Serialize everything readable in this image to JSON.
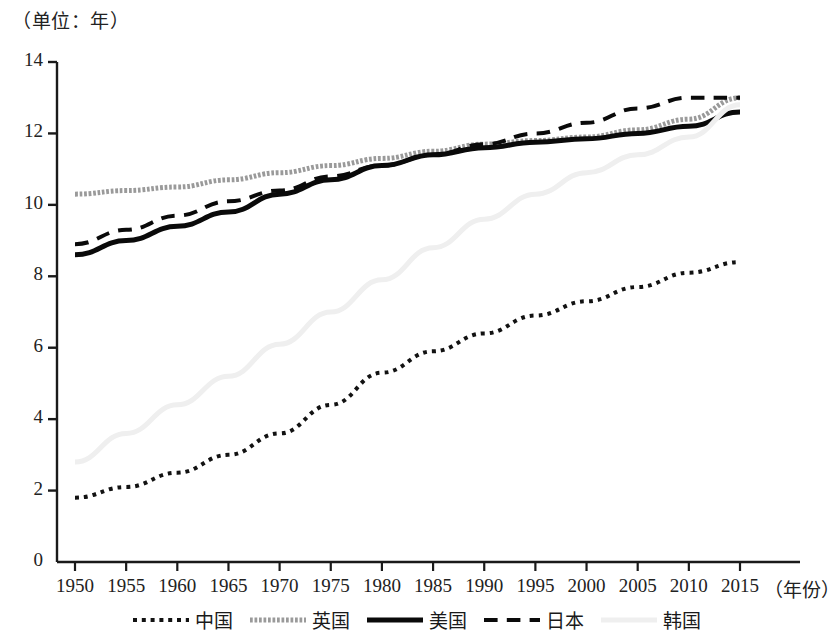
{
  "figure": {
    "unit_label": "（单位：年）",
    "xaxis_title": "（年份）"
  },
  "chart_data": {
    "type": "line",
    "title": "",
    "subtitle": "",
    "unit_note": "（单位：年）",
    "xlabel": "（年份）",
    "ylabel": "",
    "xlim": [
      1950,
      2016
    ],
    "ylim": [
      0,
      14
    ],
    "grid": false,
    "legend_position": "bottom",
    "x_ticks": [
      "1950",
      "1955",
      "1960",
      "1965",
      "1970",
      "1975",
      "1980",
      "1985",
      "1990",
      "1995",
      "2000",
      "2005",
      "2010",
      "2015"
    ],
    "y_ticks": [
      "0",
      "2",
      "4",
      "6",
      "8",
      "10",
      "12",
      "14"
    ],
    "x": [
      1950,
      1955,
      1960,
      1965,
      1970,
      1975,
      1980,
      1985,
      1990,
      1995,
      2000,
      2005,
      2010,
      2015
    ],
    "series": [
      {
        "name": "中国",
        "style": "dotted",
        "color": "#121212",
        "width": 4,
        "values": [
          1.8,
          2.1,
          2.5,
          3.0,
          3.6,
          4.4,
          5.3,
          5.9,
          6.4,
          6.9,
          7.3,
          7.7,
          8.1,
          8.4
        ]
      },
      {
        "name": "英国",
        "style": "textured",
        "color": "#9a9a9a",
        "width": 5,
        "values": [
          10.3,
          10.4,
          10.5,
          10.7,
          10.9,
          11.1,
          11.3,
          11.5,
          11.7,
          11.8,
          11.9,
          12.1,
          12.4,
          13.0
        ]
      },
      {
        "name": "美国",
        "style": "solid",
        "color": "#0a0a0a",
        "width": 5,
        "values": [
          8.6,
          9.0,
          9.4,
          9.8,
          10.3,
          10.7,
          11.1,
          11.4,
          11.6,
          11.75,
          11.85,
          12.0,
          12.2,
          12.6
        ]
      },
      {
        "name": "日本",
        "style": "dashed",
        "color": "#0a0a0a",
        "width": 4,
        "values": [
          8.9,
          9.3,
          9.7,
          10.1,
          10.4,
          10.8,
          11.1,
          11.4,
          11.7,
          12.0,
          12.3,
          12.7,
          13.0,
          13.0
        ]
      },
      {
        "name": "韩国",
        "style": "solid-light",
        "color": "#efefef",
        "width": 5,
        "values": [
          2.8,
          3.6,
          4.4,
          5.2,
          6.1,
          7.0,
          7.9,
          8.8,
          9.6,
          10.3,
          10.9,
          11.4,
          11.9,
          12.8
        ]
      }
    ]
  },
  "legend": {
    "items": [
      {
        "label": "中国",
        "swatch": "dotted-swatch"
      },
      {
        "label": "英国",
        "swatch": "textured-swatch"
      },
      {
        "label": "美国",
        "swatch": "solid-swatch"
      },
      {
        "label": "日本",
        "swatch": "dashed-swatch"
      },
      {
        "label": "韩国",
        "swatch": "light-swatch"
      }
    ]
  }
}
